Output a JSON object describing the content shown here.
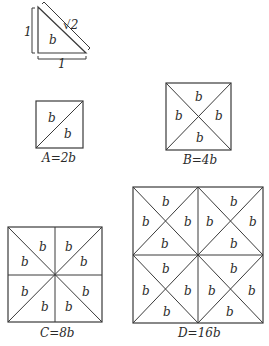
{
  "triangle": {
    "leg_vertical_label": "1",
    "leg_horizontal_label": "1",
    "hypotenuse_label": "√2",
    "area_label": "b"
  },
  "squares": [
    {
      "id": "A",
      "caption": "A=2b",
      "cell_label": "b",
      "pieces": 2
    },
    {
      "id": "B",
      "caption": "B=4b",
      "cell_label": "b",
      "pieces": 4
    },
    {
      "id": "C",
      "caption": "C=8b",
      "cell_label": "b",
      "pieces": 8
    },
    {
      "id": "D",
      "caption": "D=16b",
      "cell_label": "b",
      "pieces": 16
    }
  ]
}
